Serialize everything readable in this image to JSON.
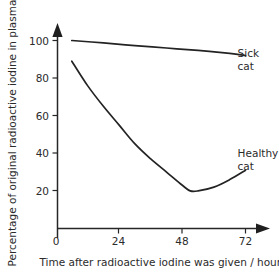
{
  "chart_data": {
    "type": "line",
    "title": "",
    "xlabel": "Time after radioactive iodine was given / hours",
    "ylabel": "Percentage of original radioactive iodine in plasma",
    "xlim": [
      0,
      78
    ],
    "ylim": [
      0,
      108
    ],
    "xticks": [
      0,
      24,
      48,
      72
    ],
    "xtick_labels": [
      "0",
      "24",
      "48",
      "72"
    ],
    "yticks": [
      20,
      40,
      60,
      80,
      100
    ],
    "ytick_labels": [
      "20",
      "40",
      "60",
      "80",
      "100"
    ],
    "grid": false,
    "legend": "inline-labels",
    "axis_arrows": true,
    "series": [
      {
        "name": "Sick cat",
        "label_line1": "Sick",
        "label_line2": "cat",
        "label_x": 69,
        "label_y": 91,
        "color": "#232323",
        "x": [
          6,
          18,
          30,
          42,
          54,
          66,
          72
        ],
        "values": [
          100,
          98.7,
          97.3,
          96.0,
          94.7,
          93.1,
          92.0
        ]
      },
      {
        "name": "Healthy cat",
        "label_line1": "Healthy",
        "label_line2": "cat",
        "label_x": 69,
        "label_y": 38,
        "color": "#232323",
        "x": [
          6,
          12,
          18,
          24,
          30,
          36,
          42,
          48,
          51,
          54,
          60,
          66,
          72
        ],
        "values": [
          89,
          76,
          65,
          55,
          45,
          37,
          30,
          23,
          20,
          20,
          22,
          26,
          31
        ]
      }
    ]
  },
  "xtick_labels": {
    "t0": "0",
    "t24": "24",
    "t48": "48",
    "t72": "72"
  },
  "ytick_labels": {
    "v20": "20",
    "v40": "40",
    "v60": "60",
    "v80": "80",
    "v100": "100"
  },
  "labels": {
    "x_axis_title": "Time after radioactive iodine was given / hours",
    "y_axis_title": "Percentage of original radioactive iodine in plasma",
    "sick_line1": "Sick",
    "sick_line2": "cat",
    "healthy_line1": "Healthy",
    "healthy_line2": "cat"
  },
  "colors": {
    "background": "#ffffff",
    "ink": "#2b2b2b",
    "line": "#232323"
  }
}
